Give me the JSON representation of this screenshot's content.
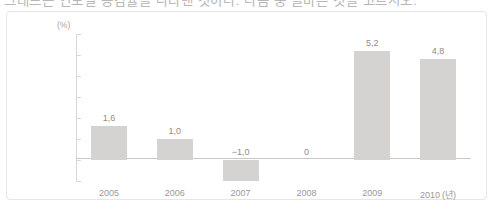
{
  "title_strip": {
    "text": "그래프는 연도별 증감률을 나타낸 것이다. 다음 중 올바른 것을 고르시오."
  },
  "chart_data": {
    "type": "bar",
    "title": "",
    "xlabel": "",
    "ylabel": "",
    "y_unit_label": "(%)",
    "x_unit_label": "(년)",
    "categories": [
      "2005",
      "2006",
      "2007",
      "2008",
      "2009",
      "2010"
    ],
    "values": [
      1.6,
      1.0,
      -1.0,
      0,
      5.2,
      4.8
    ],
    "value_labels": [
      "1,6",
      "1,0",
      "−1,0",
      "0",
      "5,2",
      "4,8"
    ],
    "ylim": [
      -1,
      6
    ],
    "ytick_values": [
      6,
      5,
      4,
      3,
      2,
      1,
      0,
      -1
    ],
    "ytick_labels": [
      "6",
      "5",
      "4",
      "3",
      "2",
      "−1",
      "0",
      "−1"
    ],
    "grid": false,
    "legend": false,
    "bar_color": "#d5d3d1",
    "axis_color": "#d9d7d6",
    "baseline_color": "#c9c7c6",
    "label_color": "#8f8c8b",
    "tick_color": "#a8a5a4",
    "panel_border_color": "#e6e6e6"
  }
}
